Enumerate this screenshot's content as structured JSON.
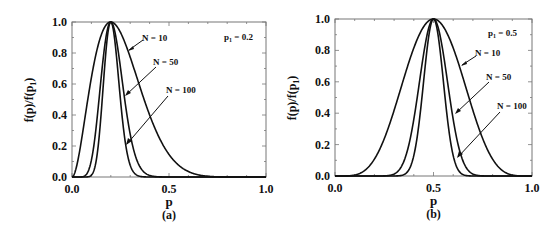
{
  "chart_data": [
    {
      "type": "line",
      "panel_label": "(a)",
      "xlabel": "p",
      "ylabel": "f(p)/f(p1)",
      "xlim": [
        0.0,
        1.0
      ],
      "ylim": [
        0.0,
        1.0
      ],
      "xticks": [
        "0.0",
        "0.5",
        "1.0"
      ],
      "yticks": [
        "0.0",
        "0.2",
        "0.4",
        "0.6",
        "0.8",
        "1.0"
      ],
      "annotation": "p1 = 0.2",
      "p1": 0.2,
      "grid": false,
      "series": [
        {
          "name": "N = 10",
          "N": 10,
          "label": "N = 10"
        },
        {
          "name": "N = 50",
          "N": 50,
          "label": "N = 50"
        },
        {
          "name": "N = 100",
          "N": 100,
          "label": "N = 100"
        }
      ]
    },
    {
      "type": "line",
      "panel_label": "(b)",
      "xlabel": "p",
      "ylabel": "f(p)/f(p1)",
      "xlim": [
        0.0,
        1.0
      ],
      "ylim": [
        0.0,
        1.0
      ],
      "xticks": [
        "0.0",
        "0.5",
        "1.0"
      ],
      "yticks": [
        "0.0",
        "0.2",
        "0.4",
        "0.6",
        "0.8",
        "1.0"
      ],
      "annotation": "p1 = 0.5",
      "p1": 0.5,
      "grid": false,
      "series": [
        {
          "name": "N = 10",
          "N": 10,
          "label": "N = 10"
        },
        {
          "name": "N = 50",
          "N": 50,
          "label": "N = 50"
        },
        {
          "name": "N = 100",
          "N": 100,
          "label": "N = 100"
        }
      ]
    }
  ],
  "panels": {
    "a": {
      "label": "(a)",
      "xlabel": "p",
      "ylabel_main": "f(p)/f(p",
      "ylabel_sub": "1",
      "ylabel_close": ")",
      "annot_p": "p",
      "annot_sub": "1",
      "annot_val": " = 0.2",
      "n10": "N = 10",
      "n50": "N = 50",
      "n100": "N = 100",
      "xt0": "0.0",
      "xt1": "0.5",
      "xt2": "1.0",
      "yt0": "0.0",
      "yt1": "0.2",
      "yt2": "0.4",
      "yt3": "0.6",
      "yt4": "0.8",
      "yt5": "1.0"
    },
    "b": {
      "label": "(b)",
      "xlabel": "p",
      "ylabel_main": "f(p)/f(p",
      "ylabel_sub": "1",
      "ylabel_close": ")",
      "annot_p": "p",
      "annot_sub": "1",
      "annot_val": " = 0.5",
      "n10": "N = 10",
      "n50": "N = 50",
      "n100": "N = 100",
      "xt0": "0.0",
      "xt1": "0.5",
      "xt2": "1.0",
      "yt0": "0.0",
      "yt1": "0.2",
      "yt2": "0.4",
      "yt3": "0.6",
      "yt4": "0.8",
      "yt5": "1.0"
    }
  },
  "colors": {
    "line": "#111111",
    "frame": "#555555",
    "background": "#ffffff"
  }
}
